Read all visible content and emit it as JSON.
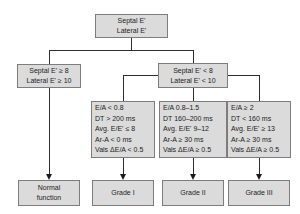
{
  "flowchart": {
    "title": "Diastolic function grading decision tree",
    "root": {
      "line1": "Septal E'",
      "line2": "Lateral E'"
    },
    "normal_branch": {
      "line1": "Septal E' ≥ 8",
      "line2": "Lateral E' ≥ 10"
    },
    "reduced_branch": {
      "line1": "Septal E' < 8",
      "line2": "Lateral E' < 10"
    },
    "criteria": [
      {
        "lines": [
          "E/A < 0.8",
          "DT > 200 ms",
          "Avg. E/E' ≤ 8",
          "Ar-A < 0 ms",
          "Vals ΔE/A < 0.5"
        ]
      },
      {
        "lines": [
          "E/A 0.8–1.5",
          "DT 160–200 ms",
          "Avg. E/E' 9–12",
          "Ar-A ≥ 30 ms",
          "Vals ΔE/A ≥ 0.5"
        ]
      },
      {
        "lines": [
          "E/A ≥ 2",
          "DT < 160 ms",
          "Avg. E/E' ≥ 13",
          "Ar-A ≥ 30 ms",
          "Vals ΔE/A ≥ 0.5"
        ]
      }
    ],
    "outcomes": {
      "normal": {
        "line1": "Normal",
        "line2": "function"
      },
      "grade1": {
        "label": "Grade I"
      },
      "grade2": {
        "label": "Grade II"
      },
      "grade3": {
        "label": "Grade III"
      }
    },
    "colors": {
      "box_fill": "#dbdbdb",
      "box_border": "#7d7d7d",
      "connector": "#2e2e2e",
      "text": "#1c1c1c",
      "background": "#ffffff"
    }
  }
}
